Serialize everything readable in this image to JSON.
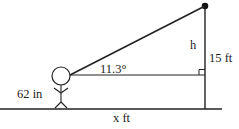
{
  "diagram": {
    "labels": {
      "angle": "11.3°",
      "height_segment": "h",
      "pole_height": "15 ft",
      "person_height": "62 in",
      "distance": "x ft"
    },
    "colors": {
      "line": "#222222",
      "background": "#ffffff"
    }
  }
}
